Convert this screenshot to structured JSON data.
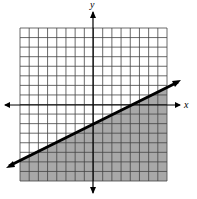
{
  "chart_data": {
    "type": "line",
    "title": "",
    "xlabel": "x",
    "ylabel": "y",
    "xlim": [
      -8,
      8
    ],
    "ylim": [
      -8,
      8
    ],
    "grid": true,
    "series": [
      {
        "name": "boundary",
        "equation": "y = 0.5x - 2",
        "x": [
          -8.6,
          9.6
        ],
        "y": [
          -6.3,
          2.8
        ],
        "style": "solid"
      }
    ],
    "shaded_region": "below line",
    "shade_color": "#a8a8a8"
  },
  "labels": {
    "x": "x",
    "y": "y"
  }
}
